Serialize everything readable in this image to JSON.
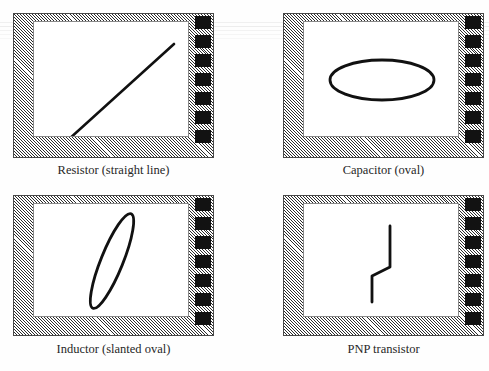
{
  "figure": {
    "background_color": "#fefefe",
    "trace_color": "#111111",
    "bezel_hatch_color": "#2b2b2b",
    "key_color": "#121212",
    "panel_count": 4
  },
  "panels": [
    {
      "id": "resistor",
      "caption": "Resistor (straight line)",
      "waveform": {
        "type": "line",
        "description": "straight diagonal line rising left to right",
        "points": "34,118 140,22"
      },
      "key_squares": 7
    },
    {
      "id": "capacitor",
      "caption": "Capacitor (oval)",
      "waveform": {
        "type": "ellipse",
        "description": "wide horizontal oval",
        "cx": 78,
        "cy": 58,
        "rx": 52,
        "ry": 20,
        "rotation": 0
      },
      "key_squares": 7
    },
    {
      "id": "inductor",
      "caption": "Inductor (slanted oval)",
      "waveform": {
        "type": "ellipse",
        "description": "narrow ellipse slanted steeply up to the right",
        "cx": 78,
        "cy": 58,
        "rx": 11,
        "ry": 51,
        "rotation": 22
      },
      "key_squares": 7
    },
    {
      "id": "pnp-transistor",
      "caption": "PNP transistor",
      "waveform": {
        "type": "polyline",
        "description": "z-shaped step trace, vertical segments joined by a short slanted step",
        "points": "68,98 68,72 86,63 86,22"
      },
      "key_squares": 7
    }
  ]
}
